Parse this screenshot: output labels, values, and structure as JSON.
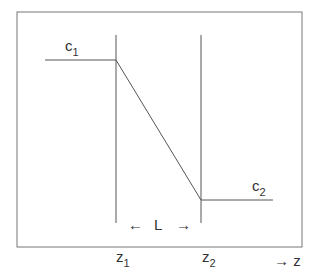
{
  "diagram": {
    "labels": {
      "c1": "c",
      "c1_sub": "1",
      "c2": "c",
      "c2_sub": "2",
      "z1": "z",
      "z1_sub": "1",
      "z2": "z",
      "z2_sub": "2",
      "length": "L",
      "left_arrow": "←",
      "right_arrow": "→",
      "axis": "→ z"
    },
    "colors": {
      "line": "#555555",
      "text": "#333333"
    }
  }
}
